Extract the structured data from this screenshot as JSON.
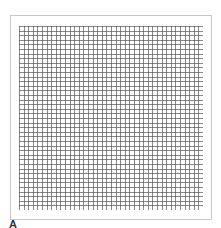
{
  "figure": {
    "panel_label": "A",
    "grid": {
      "columns": 40,
      "rows": 40,
      "line_color": "#555555",
      "frame_color": "#c8c8c8",
      "background": "#ffffff"
    }
  }
}
